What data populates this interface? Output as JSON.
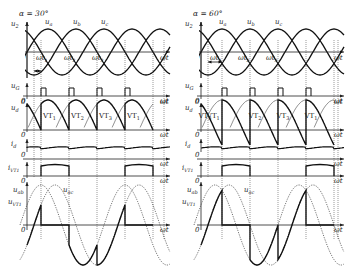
{
  "figure": {
    "panels": [
      {
        "id": "left",
        "title": "α = 30°",
        "alpha_deg": 30,
        "signals": {
          "u2": "u2",
          "phase_labels": [
            "ua",
            "ub",
            "uc"
          ],
          "time_labels": [
            "ωt1",
            "ωt2",
            "ωt3"
          ],
          "ug": "uG",
          "ud": "ud",
          "id": "id",
          "ivt1": "iVT1",
          "uvt1": "uVT1",
          "uab": "uab",
          "uac": "uac",
          "axis": "ωt",
          "origin": "0"
        },
        "vt_labels": [
          "VT1",
          "VT2",
          "VT3",
          "VT1"
        ]
      },
      {
        "id": "right",
        "title": "α = 60°",
        "alpha_deg": 60,
        "signals": {
          "u2": "u2",
          "phase_labels": [
            "ua",
            "ub",
            "uc"
          ],
          "time_labels": [
            "ωt1",
            "ωt2",
            "ωt3"
          ],
          "ug": "uG",
          "ud": "ud",
          "id": "id",
          "ivt1": "iVT1",
          "uvt1": "uVT1",
          "uab": "uab",
          "uac": "uac",
          "axis": "ωt",
          "origin": "0"
        },
        "vt_labels": [
          "VT3",
          "VT1",
          "VT2",
          "VT3",
          "VT1"
        ]
      }
    ]
  }
}
